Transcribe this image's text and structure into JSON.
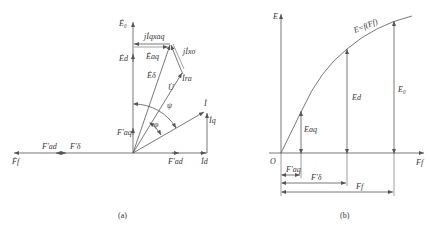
{
  "figure_a": {
    "caption": "(a)",
    "labels": {
      "E0": "Ė₀",
      "jIqxaq": "jİqxaq",
      "Ed": "Ėd",
      "Eaq": "Ėaq",
      "jIxsigma": "jİxσ",
      "Edelta": "Ėδ",
      "U": "U̇",
      "Ira": "İra",
      "psi": "ψ",
      "phi": "φ",
      "I": "İ",
      "Iq": "İq",
      "Faq": "F′aq",
      "Fad_left": "F′ad",
      "Fdelta": "F′δ",
      "Ff": "Ḟf",
      "Fad_right": "F′ad",
      "Id": "İd"
    }
  },
  "figure_b": {
    "caption": "(b)",
    "labels": {
      "E_axis": "E",
      "curve": "E=f(Ff)",
      "E0": "E₀",
      "Ed": "Ed",
      "Eaq": "Eaq",
      "origin": "O",
      "Ff_axis": "Ff",
      "Faq": "F′aq",
      "Fdelta": "F′δ",
      "Ff_dim": "Ff"
    }
  }
}
